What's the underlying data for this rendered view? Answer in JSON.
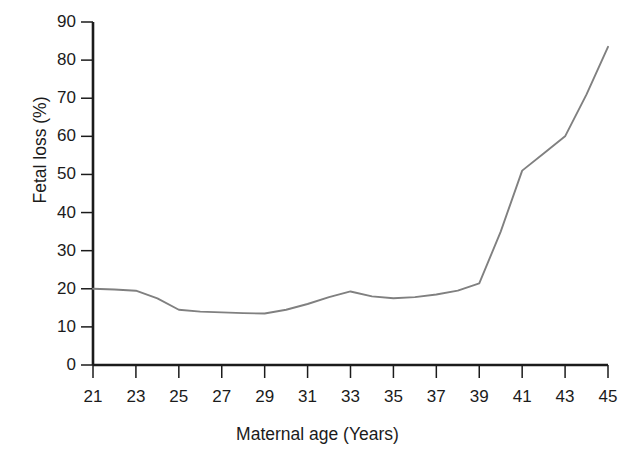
{
  "chart_data": {
    "type": "line",
    "title": "",
    "subtitle": "",
    "xlabel": "Maternal age (Years)",
    "ylabel": "Fetal loss (%)",
    "xlim": [
      21,
      45
    ],
    "ylim": [
      0,
      90
    ],
    "grid": false,
    "legend": null,
    "line_color": "#808080",
    "axis_color": "#1b1b1b",
    "background": "#ffffff",
    "x_ticks": [
      21,
      23,
      25,
      27,
      29,
      31,
      33,
      35,
      37,
      39,
      41,
      43,
      45
    ],
    "x_tick_labels": [
      "21",
      "23",
      "25",
      "27",
      "29",
      "31",
      "33",
      "35",
      "37",
      "39",
      "41",
      "43",
      "45"
    ],
    "y_ticks": [
      0,
      10,
      20,
      30,
      40,
      50,
      60,
      70,
      80,
      90
    ],
    "y_tick_labels": [
      "0",
      "10",
      "20",
      "30",
      "40",
      "50",
      "60",
      "70",
      "80",
      "90"
    ],
    "x": [
      21,
      22,
      23,
      24,
      25,
      26,
      27,
      28,
      29,
      30,
      31,
      32,
      33,
      34,
      35,
      36,
      37,
      38,
      39,
      40,
      41,
      42,
      43,
      44,
      45
    ],
    "values": [
      20.0,
      19.8,
      19.5,
      17.5,
      14.5,
      14.0,
      13.8,
      13.6,
      13.5,
      14.5,
      16.0,
      17.8,
      19.3,
      18.0,
      17.5,
      17.8,
      18.5,
      19.5,
      21.4,
      35.0,
      51.0,
      55.5,
      60.0,
      71.0,
      83.5
    ],
    "series": [
      {
        "name": "Fetal loss",
        "color": "#808080",
        "values": [
          20.0,
          19.8,
          19.5,
          17.5,
          14.5,
          14.0,
          13.8,
          13.6,
          13.5,
          14.5,
          16.0,
          17.8,
          19.3,
          18.0,
          17.5,
          17.8,
          18.5,
          19.5,
          21.4,
          35.0,
          51.0,
          55.5,
          60.0,
          71.0,
          83.5
        ]
      }
    ],
    "annotations": []
  }
}
